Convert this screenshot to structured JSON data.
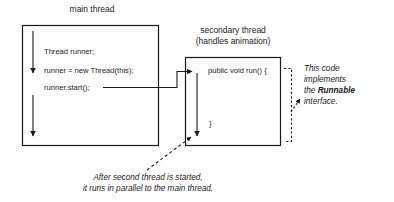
{
  "diagram": {
    "title_main_thread": "main thread",
    "title_secondary_thread_line1": "secondary thread",
    "title_secondary_thread_line2": "(handles animation)",
    "main_thread_code": [
      "Thread runner;",
      "runner = new Thread(this);",
      "runner.start();"
    ],
    "secondary_thread_code": [
      "public void run() {",
      "}"
    ],
    "side_note": {
      "line1": "This code",
      "line2": "implements",
      "line3_prefix": "the ",
      "line3_bold": "Runnable",
      "line4": "interface."
    },
    "bottom_caption": {
      "line1": "After second thread is started,",
      "line2": "it runs in parallel to the main thread."
    },
    "colors": {
      "stroke": "#1a1a1a",
      "text": "#1a1a1a",
      "background": "#ffffff"
    }
  }
}
